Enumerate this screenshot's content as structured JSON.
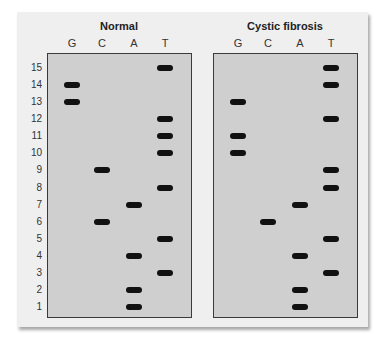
{
  "panels": [
    {
      "title": "Normal",
      "lanes": [
        "G",
        "C",
        "A",
        "T"
      ],
      "bands": {
        "G": [
          14,
          13
        ],
        "C": [
          9,
          6
        ],
        "A": [
          7,
          4,
          2,
          1
        ],
        "T": [
          15,
          12,
          11,
          10,
          8,
          5,
          3
        ]
      }
    },
    {
      "title": "Cystic fibrosis",
      "lanes": [
        "G",
        "C",
        "A",
        "T"
      ],
      "bands": {
        "G": [
          13,
          11,
          10
        ],
        "C": [
          6
        ],
        "A": [
          7,
          4,
          2,
          1
        ],
        "T": [
          15,
          14,
          12,
          9,
          8,
          5,
          3
        ]
      }
    }
  ],
  "rows": [
    "15",
    "14",
    "13",
    "12",
    "11",
    "10",
    "9",
    "8",
    "7",
    "6",
    "5",
    "4",
    "3",
    "2",
    "1"
  ],
  "colors": {
    "gel": "#cfcfcf",
    "band": "#111111",
    "card": "#efefef"
  }
}
